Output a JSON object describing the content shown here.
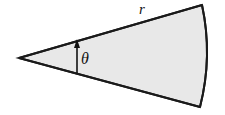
{
  "figure": {
    "name": "circular-sector-diagram",
    "width": 225,
    "height": 115,
    "background_color": "#ffffff"
  },
  "sector": {
    "fill_color": "#e8e8e8",
    "stroke_color": "#1a1a1a",
    "stroke_width": 2,
    "apex": {
      "x": 19,
      "y": 58
    },
    "upper_radius_end": {
      "x": 202,
      "y": 5
    },
    "lower_radius_end": {
      "x": 200,
      "y": 107
    },
    "arc_bulge_x": 213,
    "arc_mid_y": 56
  },
  "labels": {
    "radius": {
      "text": "r",
      "icon": "italic-r-glyph"
    },
    "angle": {
      "text": "θ",
      "icon": "italic-theta-glyph"
    }
  },
  "angle_arrow": {
    "name": "theta-angle-arrow",
    "color": "#111111",
    "stroke_width": 1.6,
    "x": 77,
    "y_tail": 73,
    "y_head": 39,
    "head_width": 6,
    "head_length": 9
  }
}
